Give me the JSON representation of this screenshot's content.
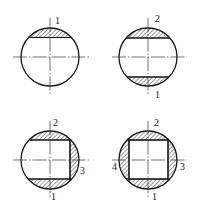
{
  "diagram": {
    "type": "machining-sequence-cross-sections",
    "colors": {
      "line": "#1a1a1a",
      "hatch": "#1a1a1a",
      "background": "#ffffff"
    },
    "figures": [
      {
        "id": "fig-1",
        "cuts": [
          "top"
        ],
        "labels": [
          {
            "text": "1",
            "position": "top"
          }
        ]
      },
      {
        "id": "fig-2",
        "cuts": [
          "top",
          "bottom"
        ],
        "labels": [
          {
            "text": "2",
            "position": "top"
          },
          {
            "text": "1",
            "position": "bottom"
          }
        ]
      },
      {
        "id": "fig-3",
        "cuts": [
          "top",
          "bottom",
          "right"
        ],
        "labels": [
          {
            "text": "2",
            "position": "top"
          },
          {
            "text": "3",
            "position": "right"
          },
          {
            "text": "1",
            "position": "bottom"
          }
        ]
      },
      {
        "id": "fig-4",
        "cuts": [
          "top",
          "bottom",
          "right",
          "left"
        ],
        "labels": [
          {
            "text": "2",
            "position": "top"
          },
          {
            "text": "4",
            "position": "left"
          },
          {
            "text": "3",
            "position": "right"
          },
          {
            "text": "1",
            "position": "bottom"
          }
        ]
      }
    ]
  }
}
